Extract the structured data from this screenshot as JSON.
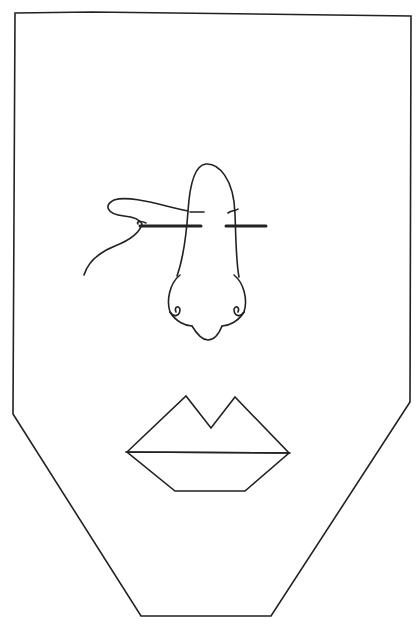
{
  "figure": {
    "parts": [
      {
        "name": "face-outline",
        "shape": "hexagon-like shield"
      },
      {
        "name": "nose",
        "shape": "curved outline with nostrils"
      },
      {
        "name": "suture-needle",
        "shape": "needle with looped thread through the nose bridge"
      },
      {
        "name": "lips",
        "shape": "angular upper lip with cupid's bow and trapezoid lower lip"
      }
    ],
    "colors": {
      "stroke": "#222222",
      "background": "#ffffff"
    }
  }
}
